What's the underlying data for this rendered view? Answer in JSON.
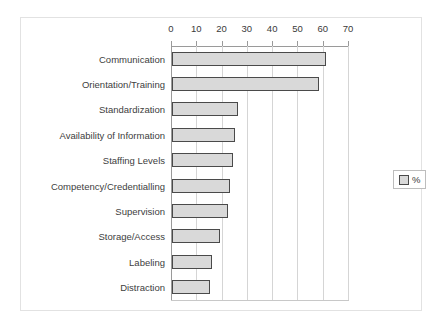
{
  "chart_data": {
    "type": "bar",
    "orientation": "horizontal",
    "title": "",
    "xlabel": "",
    "ylabel": "",
    "xlim": [
      0,
      70
    ],
    "xticks": [
      0,
      10,
      20,
      30,
      40,
      50,
      60,
      70
    ],
    "grid": true,
    "legend": {
      "position": "right",
      "entries": [
        "%"
      ]
    },
    "series_name": "%",
    "categories": [
      "Communication",
      "Orientation/Training",
      "Standardization",
      "Availability of Information",
      "Staffing Levels",
      "Competency/Credentialling",
      "Supervision",
      "Storage/Access",
      "Labeling",
      "Distraction"
    ],
    "values": [
      61,
      58,
      26,
      25,
      24,
      23,
      22,
      19,
      16,
      15
    ],
    "colors": {
      "bar_fill": "#d9d9d9",
      "bar_border": "#4a4a4a",
      "gridline": "#d5d5d5",
      "axis": "#9a9a9a",
      "frame": "#e2e2e2",
      "text": "#3a3a3a"
    }
  }
}
